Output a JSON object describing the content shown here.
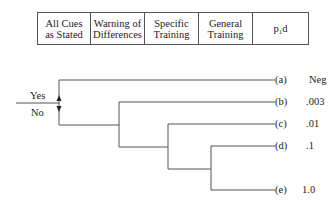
{
  "header": {
    "columns": [
      {
        "label": "All Cues\nas Stated"
      },
      {
        "label": "Warning of\nDifferences"
      },
      {
        "label": "Specific\nTraining"
      },
      {
        "label": "General\nTraining"
      },
      {
        "label": "p₁d"
      }
    ]
  },
  "tree": {
    "root_labels": {
      "yes": "Yes",
      "no": "No"
    },
    "leaves": [
      {
        "id": "(a)",
        "value": "Neg"
      },
      {
        "id": "(b)",
        "value": ".003"
      },
      {
        "id": "(c)",
        "value": ".01"
      },
      {
        "id": "(d)",
        "value": ".1"
      },
      {
        "id": "(e)",
        "value": "1.0"
      }
    ]
  }
}
